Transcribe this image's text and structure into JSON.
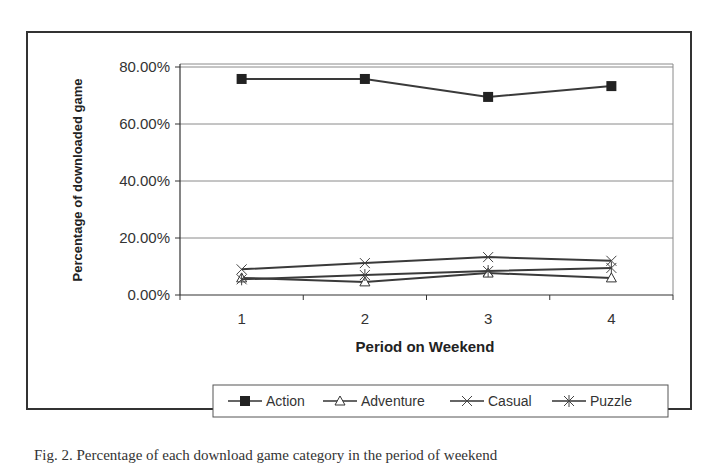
{
  "chart_data": {
    "type": "line",
    "title": "",
    "xlabel": "Period on Weekend",
    "ylabel": "Percentage of downloaded game",
    "categories": [
      "1",
      "2",
      "3",
      "4"
    ],
    "yticks": [
      "0.00%",
      "20.00%",
      "40.00%",
      "60.00%",
      "80.00%"
    ],
    "ylim": [
      0,
      80
    ],
    "grid": true,
    "legend_position": "bottom",
    "series": [
      {
        "name": "Action",
        "marker": "square",
        "values": [
          75.8,
          75.8,
          69.5,
          73.3
        ]
      },
      {
        "name": "Adventure",
        "marker": "triangle",
        "values": [
          6.0,
          4.6,
          7.7,
          6.0
        ]
      },
      {
        "name": "Casual",
        "marker": "x",
        "values": [
          9.0,
          11.2,
          13.3,
          12.0
        ]
      },
      {
        "name": "Puzzle",
        "marker": "star",
        "values": [
          5.5,
          7.0,
          8.4,
          9.5
        ]
      }
    ]
  },
  "caption": "Fig. 2. Percentage of each download game category in the period of weekend"
}
